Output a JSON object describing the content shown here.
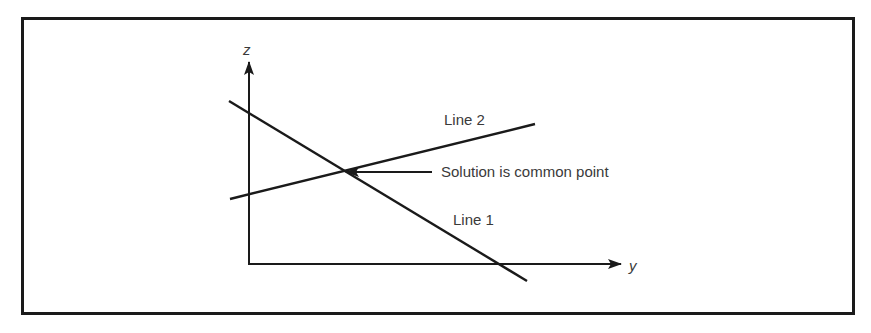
{
  "diagram": {
    "type": "two-line intersection in y-z plane",
    "axes": {
      "vertical": {
        "label": "z"
      },
      "horizontal": {
        "label": "y"
      }
    },
    "lines": [
      {
        "id": "line1",
        "label": "Line 1",
        "slope": "negative"
      },
      {
        "id": "line2",
        "label": "Line 2",
        "slope": "positive"
      }
    ],
    "annotation": {
      "text": "Solution is common point",
      "points_to": "intersection of Line 1 and Line 2"
    },
    "colors": {
      "ink": "#1a1a1a",
      "text": "#3a3a3a",
      "background": "#ffffff"
    }
  }
}
